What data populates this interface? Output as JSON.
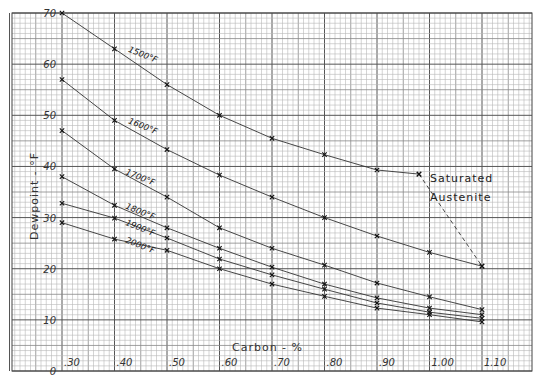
{
  "chart_data": {
    "type": "line",
    "title": "",
    "xlabel": "Carbon - %",
    "ylabel": "Dewpoint - °F",
    "xlim": [
      0.3,
      1.1
    ],
    "ylim": [
      0,
      70
    ],
    "grid": true,
    "legend_position": "inline labels on curves",
    "x_tick_labels": [
      ".30",
      ".40",
      ".50",
      ".60",
      ".70",
      ".80",
      ".90",
      "1.00",
      "1.10"
    ],
    "x_ticks": [
      0.3,
      0.4,
      0.5,
      0.6,
      0.7,
      0.8,
      0.9,
      1.0,
      1.1
    ],
    "y_tick_labels": [
      "0",
      "10",
      "20",
      "30",
      "40",
      "50",
      "60",
      "70"
    ],
    "y_ticks": [
      0,
      10,
      20,
      30,
      40,
      50,
      60,
      70
    ],
    "series": [
      {
        "name": "1500°F",
        "label": "1500°F",
        "x": [
          0.3,
          0.4,
          0.5,
          0.6,
          0.7,
          0.8,
          0.9,
          0.98
        ],
        "values": [
          70,
          63,
          56,
          50,
          45.5,
          42.3,
          39.3,
          38.5
        ],
        "label_pos": [
          0.425,
          62.5
        ]
      },
      {
        "name": "1600°F",
        "label": "1600°F",
        "x": [
          0.3,
          0.4,
          0.5,
          0.6,
          0.7,
          0.8,
          0.9,
          1.0,
          1.1
        ],
        "values": [
          57,
          49,
          43.3,
          38.3,
          34,
          30,
          26.4,
          23.2,
          20.5
        ],
        "label_pos": [
          0.425,
          48.5
        ]
      },
      {
        "name": "1700°F",
        "label": "1700°F",
        "x": [
          0.3,
          0.4,
          0.5,
          0.6,
          0.7,
          0.8,
          0.9,
          1.0,
          1.1
        ],
        "values": [
          47,
          39.5,
          34,
          28,
          24,
          20.7,
          17.2,
          14.5,
          12
        ],
        "label_pos": [
          0.42,
          38.5
        ]
      },
      {
        "name": "1800°F",
        "label": "1800°F",
        "x": [
          0.3,
          0.4,
          0.5,
          0.6,
          0.7,
          0.8,
          0.9,
          1.0,
          1.1
        ],
        "values": [
          38,
          32.4,
          28,
          24,
          20.3,
          17,
          14.3,
          12.3,
          11
        ],
        "label_pos": [
          0.42,
          31.8
        ]
      },
      {
        "name": "1900°F",
        "label": "1900°F",
        "x": [
          0.3,
          0.4,
          0.5,
          0.6,
          0.7,
          0.8,
          0.9,
          1.0,
          1.1
        ],
        "values": [
          32.8,
          29.9,
          26,
          21.9,
          18.8,
          16,
          13.3,
          11.5,
          10.3
        ],
        "label_pos": [
          0.42,
          28.6
        ]
      },
      {
        "name": "2000°F",
        "label": "2000°F",
        "x": [
          0.3,
          0.4,
          0.5,
          0.6,
          0.7,
          0.8,
          0.9,
          1.0,
          1.1
        ],
        "values": [
          29,
          25.8,
          23.6,
          20,
          17,
          14.6,
          12.3,
          11,
          9.6
        ],
        "label_pos": [
          0.42,
          25.2
        ]
      },
      {
        "name": "Saturated Austenite",
        "label": "",
        "dashed": true,
        "x": [
          0.98,
          1.1
        ],
        "values": [
          38.5,
          20.5
        ]
      }
    ],
    "annotations": [
      {
        "text": "Saturated",
        "x": 0.985,
        "y": 42
      },
      {
        "text": "Austenite",
        "x": 0.985,
        "y": 38
      }
    ]
  },
  "labels": {
    "xlabel": "Carbon - %",
    "ylabel": "Dewpoint - °F",
    "annotation_line1": "Saturated",
    "annotation_line2": "Austenite"
  }
}
